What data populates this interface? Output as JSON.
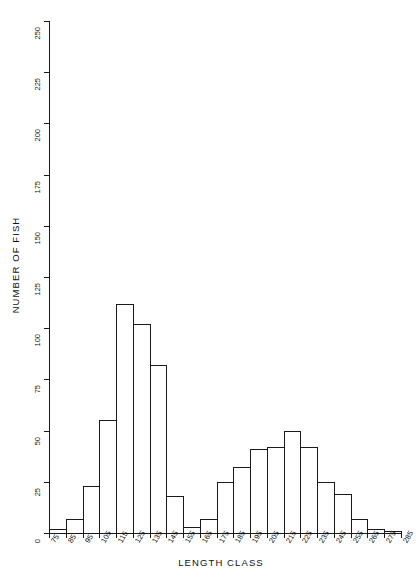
{
  "chart_data": {
    "type": "bar",
    "title": "",
    "xlabel": "LENGTH CLASS",
    "ylabel": "NUMBER OF FISH",
    "ylim": [
      0,
      250
    ],
    "yticks": [
      0,
      25,
      50,
      75,
      100,
      125,
      150,
      175,
      200,
      225,
      250
    ],
    "xticks": [
      75,
      85,
      95,
      105,
      115,
      125,
      135,
      145,
      155,
      165,
      175,
      185,
      195,
      205,
      215,
      225,
      235,
      245,
      255,
      265,
      275,
      285
    ],
    "categories": [
      75,
      85,
      95,
      105,
      115,
      125,
      135,
      145,
      155,
      165,
      175,
      185,
      195,
      205,
      215,
      225,
      235,
      245,
      255,
      265,
      275
    ],
    "values": [
      2,
      7,
      23,
      55,
      112,
      102,
      82,
      18,
      3,
      7,
      25,
      32,
      41,
      42,
      50,
      42,
      25,
      19,
      7,
      2,
      1
    ],
    "bin_width": 10,
    "grid": false,
    "legend": null,
    "series": [
      {
        "name": "NUMBER OF FISH",
        "values": [
          2,
          7,
          23,
          55,
          112,
          102,
          82,
          18,
          3,
          7,
          25,
          32,
          41,
          42,
          50,
          42,
          25,
          19,
          7,
          2,
          1
        ]
      }
    ]
  },
  "axes": {
    "y_tick_labels": [
      "0",
      "25",
      "50",
      "75",
      "100",
      "125",
      "150",
      "175",
      "200",
      "225",
      "250"
    ],
    "x_tick_labels": [
      "75",
      "85",
      "95",
      "105",
      "115",
      "125",
      "135",
      "145",
      "155",
      "165",
      "175",
      "185",
      "195",
      "205",
      "215",
      "225",
      "235",
      "245",
      "255",
      "265",
      "275",
      "285"
    ],
    "y_axis_title": "NUMBER OF FISH",
    "x_axis_title": "LENGTH CLASS"
  },
  "style": {
    "ink": "#1a1a1a",
    "background": "#ffffff",
    "bar_fill": "none"
  }
}
